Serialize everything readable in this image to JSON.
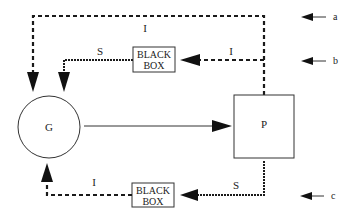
{
  "diagram": {
    "nodes": {
      "g": {
        "label": "G"
      },
      "p": {
        "label": "P"
      },
      "black_box_top": {
        "line1": "BLACK",
        "line2": "BOX"
      },
      "black_box_bottom": {
        "line1": "BLACK",
        "line2": "BOX"
      }
    },
    "edge_labels": {
      "top_loop": "I",
      "top_box_to_g": "S",
      "p_to_top_box": "I",
      "bottom_box_to_g": "I",
      "p_to_bottom_box": "S"
    },
    "level_markers": {
      "a": "a",
      "b": "b",
      "c": "c"
    },
    "colors": {
      "stroke": "#1a1a1a",
      "background": "#ffffff"
    }
  }
}
